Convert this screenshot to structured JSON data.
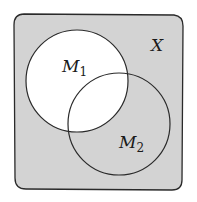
{
  "diagram": {
    "type": "venn",
    "universe": {
      "label": "X",
      "fill": "#d3d3d3",
      "stroke": "#2a2a2a"
    },
    "sets": [
      {
        "name": "M",
        "subscript": "1",
        "fill": "#ffffff",
        "stroke": "#2a2a2a"
      },
      {
        "name": "M",
        "subscript": "2",
        "fill": "none",
        "stroke": "#2a2a2a"
      }
    ],
    "shaded_region": "X \\ M1"
  }
}
